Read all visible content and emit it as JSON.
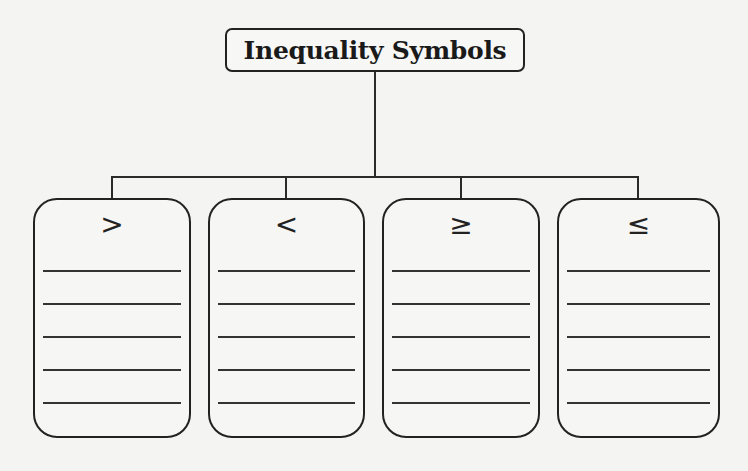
{
  "diagram": {
    "title": "Inequality Symbols",
    "boxes": [
      {
        "symbol": ">",
        "name": "greater-than",
        "lines": 5
      },
      {
        "symbol": "<",
        "name": "less-than",
        "lines": 5
      },
      {
        "symbol": "≥",
        "name": "greater-than-or-equal",
        "lines": 5
      },
      {
        "symbol": "≤",
        "name": "less-than-or-equal",
        "lines": 5
      }
    ]
  },
  "colors": {
    "background": "#f4f4f2",
    "stroke": "#222222"
  }
}
